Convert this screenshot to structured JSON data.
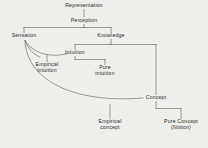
{
  "diagram": {
    "background_color": "#eeeeea",
    "line_color": "#5a5a5a",
    "text_color": "#2a2a2a",
    "nodes": [
      {
        "id": "representation",
        "label": "Representation",
        "x": 84,
        "y": 6
      },
      {
        "id": "perception",
        "label": "Perception",
        "x": 84,
        "y": 21
      },
      {
        "id": "sensation",
        "label": "Sensation",
        "x": 24,
        "y": 36
      },
      {
        "id": "knowledge",
        "label": "Knowledge",
        "x": 111,
        "y": 36
      },
      {
        "id": "intuition",
        "label": "Intuition",
        "x": 75,
        "y": 53
      },
      {
        "id": "empirical-intuition",
        "label": "Empirical\nintuition",
        "x": 47,
        "y": 65
      },
      {
        "id": "pure-intuition",
        "label": "Pure\nintuition",
        "x": 105,
        "y": 68
      },
      {
        "id": "concept",
        "label": "Concept",
        "x": 156,
        "y": 98
      },
      {
        "id": "empirical-concept",
        "label": "Empirical\nconcept",
        "x": 110,
        "y": 122
      },
      {
        "id": "pure-concept",
        "label": "Pure Concept\n(Notion)",
        "x": 181,
        "y": 122
      }
    ],
    "edges": [
      {
        "id": "representation-to-perception",
        "from": "representation",
        "to": "perception",
        "kind": "vertical"
      },
      {
        "id": "perception-to-sensation",
        "from": "perception",
        "to": "sensation",
        "kind": "bracket"
      },
      {
        "id": "perception-to-knowledge",
        "from": "perception",
        "to": "knowledge",
        "kind": "bracket"
      },
      {
        "id": "sensation-to-intuition",
        "from": "sensation",
        "to": "intuition",
        "kind": "curve"
      },
      {
        "id": "sensation-to-empirical-intuition",
        "from": "sensation",
        "to": "empirical-intuition",
        "kind": "curve"
      },
      {
        "id": "knowledge-to-intuition",
        "from": "knowledge",
        "to": "intuition",
        "kind": "bracket"
      },
      {
        "id": "knowledge-to-concept",
        "from": "knowledge",
        "to": "concept",
        "kind": "bracket"
      },
      {
        "id": "intuition-to-pure-intuition",
        "from": "intuition",
        "to": "pure-intuition",
        "kind": "bracket"
      },
      {
        "id": "sensation-to-empirical-concept",
        "from": "sensation",
        "to": "empirical-concept",
        "kind": "curve"
      },
      {
        "id": "concept-to-empirical-concept",
        "from": "concept",
        "to": "empirical-concept",
        "kind": "curve"
      },
      {
        "id": "concept-to-pure-concept",
        "from": "concept",
        "to": "pure-concept",
        "kind": "bracket"
      }
    ]
  }
}
